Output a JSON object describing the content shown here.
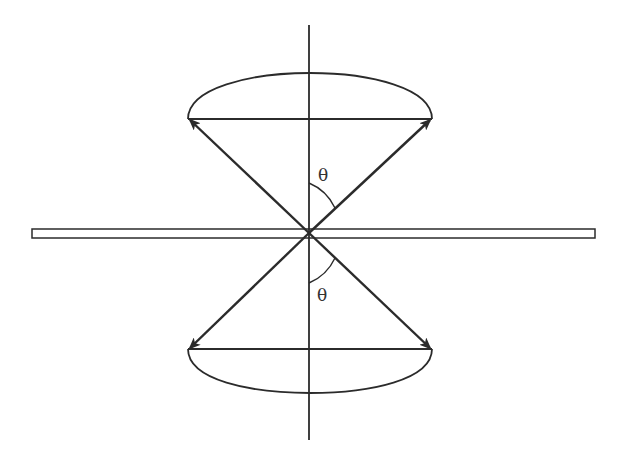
{
  "diagram": {
    "type": "vector-cone-diagram",
    "colors": {
      "stroke": "#2b2b2b",
      "background": "#ffffff",
      "plate_fill": "#ffffff"
    },
    "labels": {
      "theta_top": "θ",
      "theta_bottom": "θ"
    },
    "elements": {
      "vertical_axis": "vertical axis",
      "horizontal_plate": "horizontal plate",
      "upper_cone": "upper precession cone",
      "lower_cone": "lower precession cone",
      "arrows": [
        "upper-left vector",
        "upper-right vector",
        "lower-left vector",
        "lower-right vector"
      ]
    }
  }
}
